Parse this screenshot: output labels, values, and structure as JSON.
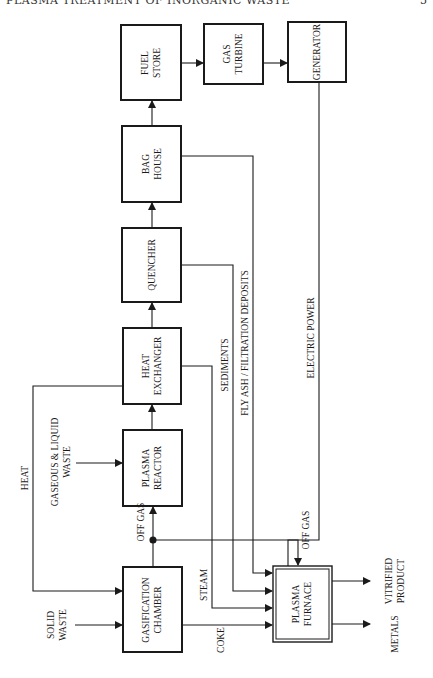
{
  "page": {
    "header": "PLASMA TREATMENT OF INORGANIC WASTE",
    "page_number": "5"
  },
  "diagram": {
    "boxes": {
      "fuel_store": [
        "FUEL",
        "STORE"
      ],
      "gas_turbine": [
        "GAS",
        "TURBINE"
      ],
      "generator": [
        "GENERATOR"
      ],
      "bag_house": [
        "BAG",
        "HOUSE"
      ],
      "quencher": [
        "QUENCHER"
      ],
      "heat_exchanger": [
        "HEAT",
        "EXCHANGER"
      ],
      "plasma_reactor": [
        "PLASMA",
        "REACTOR"
      ],
      "gasification_chamber": [
        "GASIFICATION",
        "CHAMBER"
      ],
      "plasma_furnace": [
        "PLASMA",
        "FURNACE"
      ]
    },
    "flows": {
      "heat": "HEAT",
      "gaseous_liquid_waste": [
        "GASEOUS & LIQUID",
        "WASTE"
      ],
      "off_gas_1": "OFF GAS",
      "off_gas_2": "OFF GAS",
      "solid_waste": [
        "SOLID",
        "WASTE"
      ],
      "steam": "STEAM",
      "coke": "COKE",
      "sediments": "SEDIMENTS",
      "fly_ash": "FLY ASH / FILTRATION DEPOSITS",
      "electric_power": "ELECTRIC POWER",
      "vitrified_product": [
        "VITRIFIED",
        "PRODUCT"
      ],
      "metals": "METALS"
    }
  }
}
